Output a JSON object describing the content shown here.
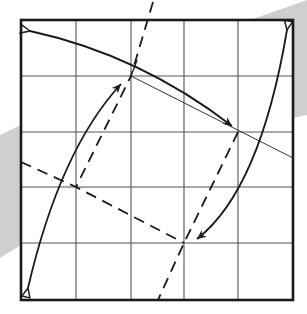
{
  "diagram": {
    "colors": {
      "background": "#ffffff",
      "band": "#cfcfcf",
      "paper": "#ffffff",
      "border": "#1a1a1a",
      "grid": "#555555",
      "ink": "#1a1a1a"
    },
    "square": {
      "x": 21,
      "y": 20,
      "width": 272,
      "height": 280
    },
    "grid": {
      "columns": 5,
      "rows": 5,
      "vertical_x": [
        76,
        131,
        184,
        238
      ],
      "horizontal_y": [
        76,
        132,
        187,
        243
      ]
    },
    "band_polygon": "250,20 307,0 307,115 293,118 293,20",
    "band_polygon_left": "0,135 21,125 21,245 0,258",
    "crease_line": {
      "x1": 131,
      "y1": 76,
      "x2": 293,
      "y2": 158
    },
    "dashed_lines": [
      {
        "name": "dashed-line-upper",
        "d": "M153,2 L131,76 L76,187"
      },
      {
        "name": "dashed-line-lower",
        "d": "M21,162 L76,187 L184,243"
      },
      {
        "name": "dashed-line-right",
        "d": "M238,132 L184,243 L158,300"
      }
    ],
    "arrows": [
      {
        "name": "arrow-top",
        "d": "M30,31 Q140,55 232,126",
        "hollow_end": "start",
        "filled_end": "end"
      },
      {
        "name": "arrow-left",
        "d": "M28,288 Q60,150 121,84",
        "hollow_end": "start",
        "filled_end": "end"
      },
      {
        "name": "arrow-right",
        "d": "M287,30 Q260,190 197,239",
        "hollow_end": "start",
        "filled_end": "end"
      }
    ],
    "tick_mark": {
      "x1": 133,
      "y1": 70,
      "x2": 137,
      "y2": 60
    }
  }
}
